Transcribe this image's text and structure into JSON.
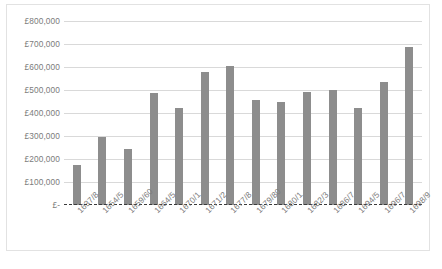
{
  "chart_data": {
    "type": "bar",
    "title": "",
    "xlabel": "",
    "ylabel": "",
    "grid": true,
    "legend": false,
    "ylim": [
      0,
      800000
    ],
    "ytick_values": [
      800000,
      700000,
      600000,
      500000,
      400000,
      300000,
      200000,
      100000,
      0
    ],
    "ytick_labels": [
      "£800,000",
      "£700,000",
      "£600,000",
      "£500,000",
      "£400,000",
      "£300,000",
      "£200,000",
      "£100,000",
      "£-"
    ],
    "categories": [
      "1637/8",
      "1654/5",
      "1659/60",
      "1664/5",
      "1670/1",
      "1671/2",
      "1677/8",
      "1679/80",
      "1680/1",
      "1682/3",
      "1686/7",
      "1694/5",
      "1696/7",
      "1698/9"
    ],
    "values": [
      172000,
      295000,
      243000,
      487000,
      423000,
      578000,
      605000,
      458000,
      446000,
      493000,
      500000,
      420000,
      535000,
      685000
    ],
    "bar_color": "#8d8d8d",
    "gridline_color": "#d9d9d9",
    "baseline_color": "#3a3a3a",
    "baseline_style": "dashed",
    "axis_text_color": "#7b7b7b"
  },
  "caption": ""
}
